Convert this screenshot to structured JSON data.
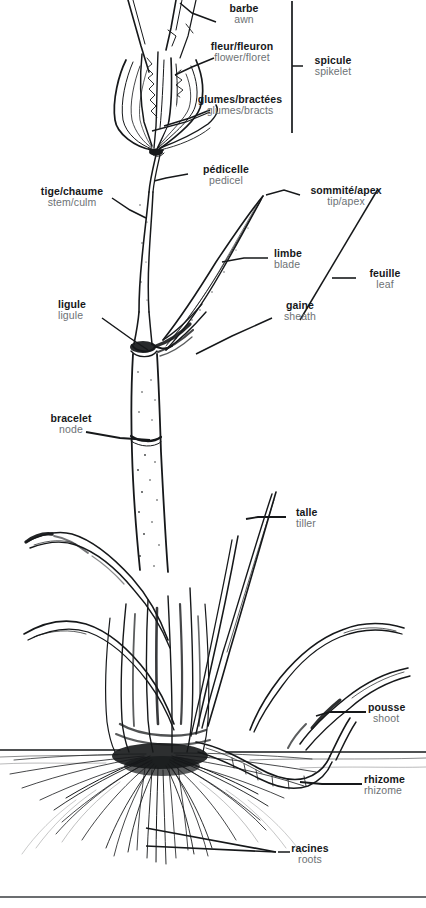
{
  "diagram": {
    "language_primary": "French",
    "language_secondary": "English",
    "colors": {
      "background": "#ffffff",
      "ink": "#16181a",
      "label_fr": "#16181a",
      "label_en": "#6d7275",
      "leader_line": "#16181a",
      "soil_line": "#16181a"
    }
  },
  "labels": [
    {
      "id": "barbe",
      "fr": "barbe",
      "en": "awn",
      "align": "center"
    },
    {
      "id": "fleur",
      "fr": "fleur/fleuron",
      "en": "flower/floret",
      "align": "center"
    },
    {
      "id": "glumes",
      "fr": "glumes/bractées",
      "en": "glumes/bracts",
      "align": "center"
    },
    {
      "id": "spicule",
      "fr": "spicule",
      "en": "spikelet",
      "align": "center"
    },
    {
      "id": "pedicelle",
      "fr": "pédicelle",
      "en": "pedicel",
      "align": "center"
    },
    {
      "id": "tige",
      "fr": "tige/chaume",
      "en": "stem/culm",
      "align": "center"
    },
    {
      "id": "sommite",
      "fr": "sommité/apex",
      "en": "tip/apex",
      "align": "center"
    },
    {
      "id": "limbe",
      "fr": "limbe",
      "en": "blade",
      "align": "left"
    },
    {
      "id": "feuille",
      "fr": "feuille",
      "en": "leaf",
      "align": "center"
    },
    {
      "id": "ligule",
      "fr": "ligule",
      "en": "ligule",
      "align": "left"
    },
    {
      "id": "gaine",
      "fr": "gaine",
      "en": "sheath",
      "align": "center"
    },
    {
      "id": "bracelet",
      "fr": "bracelet",
      "en": "node",
      "align": "center"
    },
    {
      "id": "talle",
      "fr": "talle",
      "en": "tiller",
      "align": "left"
    },
    {
      "id": "pousse",
      "fr": "pousse",
      "en": "shoot",
      "align": "left"
    },
    {
      "id": "rhizome",
      "fr": "rhizome",
      "en": "rhizome",
      "align": "left"
    },
    {
      "id": "racines",
      "fr": "racines",
      "en": "roots",
      "align": "center"
    }
  ]
}
